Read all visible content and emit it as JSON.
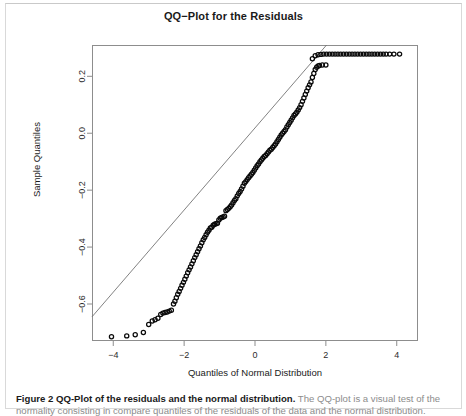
{
  "figure": {
    "caption_bold": "Figure 2 QQ-Plot of the residuals and the normal distribution.",
    "caption_rest": " The QQ-plot is a visual test of the",
    "caption_line2": "normality consisting in compare quantiles of the residuals of the data and the normal distribution."
  },
  "chart_data": {
    "type": "scatter",
    "title": "QQ−Plot for the Residuals",
    "xlabel": "Quantiles of Normal Distribution",
    "ylabel": "Sample Quantiles",
    "xticks": [
      -4,
      -2,
      0,
      2,
      4
    ],
    "xtick_labels": [
      "−4",
      "−2",
      "0",
      "2",
      "4"
    ],
    "yticks": [
      0.2,
      0.0,
      -0.2,
      -0.4,
      -0.6
    ],
    "ytick_labels": [
      "0.2",
      "0.0",
      "−0.2",
      "−0.4",
      "−0.6"
    ],
    "xlim": [
      -4.6,
      4.6
    ],
    "ylim": [
      -0.73,
      0.31
    ],
    "grid": false,
    "legend": null,
    "marker": "open-circle",
    "reference_line": {
      "style": "thin-solid-qq-line",
      "p1": [
        -4.6,
        -0.645
      ],
      "p2": [
        1.95,
        0.3
      ]
    },
    "points": [
      [
        -4.05,
        -0.715
      ],
      [
        -3.62,
        -0.712
      ],
      [
        -3.38,
        -0.708
      ],
      [
        -3.15,
        -0.7
      ],
      [
        -3.0,
        -0.672
      ],
      [
        -2.9,
        -0.66
      ],
      [
        -2.82,
        -0.655
      ],
      [
        -2.74,
        -0.65
      ],
      [
        -2.66,
        -0.637
      ],
      [
        -2.6,
        -0.632
      ],
      [
        -2.54,
        -0.63
      ],
      [
        -2.48,
        -0.628
      ],
      [
        -2.42,
        -0.625
      ],
      [
        -2.36,
        -0.622
      ],
      [
        -2.3,
        -0.6
      ],
      [
        -2.26,
        -0.59
      ],
      [
        -2.22,
        -0.578
      ],
      [
        -2.18,
        -0.566
      ],
      [
        -2.14,
        -0.556
      ],
      [
        -2.1,
        -0.545
      ],
      [
        -2.06,
        -0.534
      ],
      [
        -2.02,
        -0.524
      ],
      [
        -1.98,
        -0.513
      ],
      [
        -1.94,
        -0.502
      ],
      [
        -1.9,
        -0.49
      ],
      [
        -1.86,
        -0.48
      ],
      [
        -1.82,
        -0.47
      ],
      [
        -1.78,
        -0.459
      ],
      [
        -1.74,
        -0.448
      ],
      [
        -1.7,
        -0.437
      ],
      [
        -1.66,
        -0.427
      ],
      [
        -1.62,
        -0.416
      ],
      [
        -1.58,
        -0.406
      ],
      [
        -1.54,
        -0.396
      ],
      [
        -1.5,
        -0.385
      ],
      [
        -1.46,
        -0.374
      ],
      [
        -1.42,
        -0.366
      ],
      [
        -1.38,
        -0.357
      ],
      [
        -1.34,
        -0.348
      ],
      [
        -1.3,
        -0.341
      ],
      [
        -1.26,
        -0.333
      ],
      [
        -1.22,
        -0.33
      ],
      [
        -1.18,
        -0.323
      ],
      [
        -1.14,
        -0.32
      ],
      [
        -1.1,
        -0.318
      ],
      [
        -1.06,
        -0.316
      ],
      [
        -1.02,
        -0.305
      ],
      [
        -0.98,
        -0.299
      ],
      [
        -0.94,
        -0.296
      ],
      [
        -0.9,
        -0.294
      ],
      [
        -0.86,
        -0.292
      ],
      [
        -0.82,
        -0.272
      ],
      [
        -0.78,
        -0.268
      ],
      [
        -0.74,
        -0.264
      ],
      [
        -0.7,
        -0.258
      ],
      [
        -0.66,
        -0.252
      ],
      [
        -0.62,
        -0.244
      ],
      [
        -0.58,
        -0.236
      ],
      [
        -0.54,
        -0.23
      ],
      [
        -0.5,
        -0.22
      ],
      [
        -0.46,
        -0.212
      ],
      [
        -0.42,
        -0.205
      ],
      [
        -0.38,
        -0.196
      ],
      [
        -0.34,
        -0.186
      ],
      [
        -0.3,
        -0.176
      ],
      [
        -0.26,
        -0.17
      ],
      [
        -0.22,
        -0.163
      ],
      [
        -0.18,
        -0.156
      ],
      [
        -0.14,
        -0.15
      ],
      [
        -0.1,
        -0.144
      ],
      [
        -0.06,
        -0.138
      ],
      [
        -0.02,
        -0.13
      ],
      [
        0.02,
        -0.122
      ],
      [
        0.06,
        -0.114
      ],
      [
        0.1,
        -0.108
      ],
      [
        0.14,
        -0.1
      ],
      [
        0.18,
        -0.094
      ],
      [
        0.22,
        -0.088
      ],
      [
        0.26,
        -0.082
      ],
      [
        0.3,
        -0.078
      ],
      [
        0.34,
        -0.072
      ],
      [
        0.38,
        -0.066
      ],
      [
        0.42,
        -0.06
      ],
      [
        0.46,
        -0.056
      ],
      [
        0.5,
        -0.05
      ],
      [
        0.54,
        -0.044
      ],
      [
        0.58,
        -0.038
      ],
      [
        0.62,
        -0.03
      ],
      [
        0.66,
        -0.022
      ],
      [
        0.7,
        -0.014
      ],
      [
        0.74,
        -0.006
      ],
      [
        0.78,
        0.0
      ],
      [
        0.82,
        0.006
      ],
      [
        0.86,
        0.012
      ],
      [
        0.9,
        0.022
      ],
      [
        0.94,
        0.03
      ],
      [
        0.98,
        0.038
      ],
      [
        1.02,
        0.046
      ],
      [
        1.06,
        0.054
      ],
      [
        1.1,
        0.062
      ],
      [
        1.14,
        0.068
      ],
      [
        1.18,
        0.074
      ],
      [
        1.22,
        0.082
      ],
      [
        1.26,
        0.09
      ],
      [
        1.3,
        0.1
      ],
      [
        1.34,
        0.112
      ],
      [
        1.38,
        0.124
      ],
      [
        1.42,
        0.136
      ],
      [
        1.46,
        0.148
      ],
      [
        1.5,
        0.16
      ],
      [
        1.54,
        0.17
      ],
      [
        1.58,
        0.18
      ],
      [
        1.62,
        0.196
      ],
      [
        1.66,
        0.21
      ],
      [
        1.7,
        0.224
      ],
      [
        1.74,
        0.232
      ],
      [
        1.78,
        0.236
      ],
      [
        1.82,
        0.238
      ],
      [
        1.9,
        0.24
      ],
      [
        2.0,
        0.24
      ],
      [
        1.62,
        0.262
      ],
      [
        1.7,
        0.272
      ],
      [
        1.78,
        0.276
      ],
      [
        1.86,
        0.277
      ],
      [
        1.94,
        0.278
      ],
      [
        2.02,
        0.278
      ],
      [
        2.1,
        0.278
      ],
      [
        2.18,
        0.278
      ],
      [
        2.26,
        0.278
      ],
      [
        2.34,
        0.278
      ],
      [
        2.42,
        0.278
      ],
      [
        2.5,
        0.278
      ],
      [
        2.58,
        0.278
      ],
      [
        2.66,
        0.278
      ],
      [
        2.74,
        0.278
      ],
      [
        2.82,
        0.278
      ],
      [
        2.9,
        0.278
      ],
      [
        2.98,
        0.278
      ],
      [
        3.06,
        0.278
      ],
      [
        3.14,
        0.278
      ],
      [
        3.22,
        0.278
      ],
      [
        3.3,
        0.278
      ],
      [
        3.38,
        0.278
      ],
      [
        3.46,
        0.278
      ],
      [
        3.54,
        0.278
      ],
      [
        3.62,
        0.278
      ],
      [
        3.7,
        0.278
      ],
      [
        3.8,
        0.278
      ],
      [
        3.92,
        0.278
      ],
      [
        4.08,
        0.278
      ]
    ]
  }
}
